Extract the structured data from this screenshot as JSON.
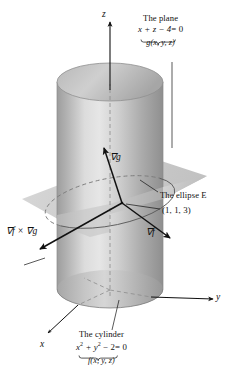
{
  "figure": {
    "title_semantic": "gradient-of-cylinder-and-plane-intersection-diagram",
    "axes": {
      "z_label": "z",
      "y_label": "y",
      "x_label": "x"
    },
    "plane_callout": {
      "line1": "The plane",
      "equation_lhs": "x + z − 4",
      "equation_rhs": "= 0",
      "underbrace_label": "g(x, y, z)"
    },
    "cylinder_callout": {
      "line1": "The cylinder",
      "equation_lhs_a": "x",
      "equation_sup_a": "2",
      "equation_mid": " + y",
      "equation_sup_b": "2",
      "equation_lhs_b": " − 2",
      "equation_rhs": "= 0",
      "underbrace_label": "f(x, y, z)"
    },
    "annotations": {
      "ellipse": "The ellipse E",
      "point": "(1, 1, 3)",
      "grad_g": "∇g",
      "grad_f": "∇f",
      "cross_product": "∇f × ∇g"
    },
    "colors": {
      "background": "#ffffff",
      "ink": "#111111",
      "cylinder_light": "#e2e2e2",
      "cylinder_mid": "#c5c5c5",
      "cylinder_dark": "#9a9a9a",
      "plane_fill": "#c9c9c9",
      "plane_fill_light": "#d8d8d8",
      "dashed_guide": "#8c8c8c"
    }
  }
}
